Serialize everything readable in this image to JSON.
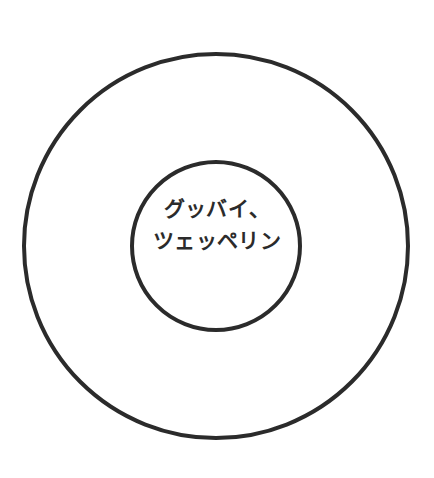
{
  "canvas": {
    "width": 434,
    "height": 478,
    "background_color": "#ffffff"
  },
  "emblem": {
    "stroke_color": "#2b2b2b",
    "fill_color": "#ffffff",
    "outer_circle": {
      "center_x": 216,
      "center_y": 246,
      "radius": 192,
      "stroke_width": 4
    },
    "inner_circle": {
      "center_x": 216,
      "center_y": 246,
      "radius": 84,
      "stroke_width": 4
    }
  },
  "label": {
    "text_color": "#2b2b2b",
    "lines": [
      "グッバイ、",
      "ツェッペリン"
    ],
    "full_text": "グッバイ、ツェッペリン"
  }
}
